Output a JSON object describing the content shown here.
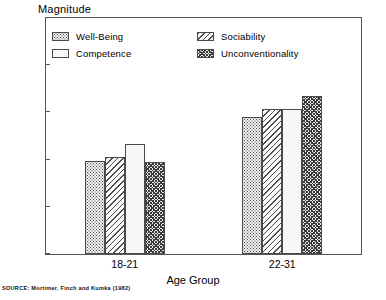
{
  "chart_data": {
    "type": "bar",
    "title": "",
    "ylabel": "Magnitude",
    "xlabel": "Age Group",
    "categories": [
      "18-21",
      "22-31"
    ],
    "series": [
      {
        "name": "Well-Being",
        "pattern": "dotted",
        "values": [
          0.395,
          0.58
        ]
      },
      {
        "name": "Sociability",
        "pattern": "diagonal-stripe",
        "values": [
          0.41,
          0.615
        ]
      },
      {
        "name": "Competence",
        "pattern": "blank",
        "values": [
          0.465,
          0.615
        ]
      },
      {
        "name": "Unconventionality",
        "pattern": "dense-hatch",
        "values": [
          0.39,
          0.67
        ]
      }
    ],
    "ylim": [
      0,
      1
    ],
    "yticks": [
      "0",
      "0.2",
      "0.4",
      "0.6",
      "0.8",
      "1"
    ],
    "ytick_values": [
      0,
      0.2,
      0.4,
      0.6,
      0.8,
      1
    ],
    "grid": false,
    "legend_position": "inside-top-left-two-column"
  },
  "legend": {
    "rows": [
      {
        "left_label": "Well-Being",
        "right_label": "Sociability"
      },
      {
        "left_label": "Competence",
        "right_label": "Unconventionality"
      }
    ]
  },
  "source": {
    "text": "SOURCE: Mortimer, Finch and Kumka (1982)"
  },
  "colors": {
    "axis": "#555555",
    "bar_outline": "#4a4a4a",
    "text": "#000000",
    "background": "#ffffff"
  }
}
